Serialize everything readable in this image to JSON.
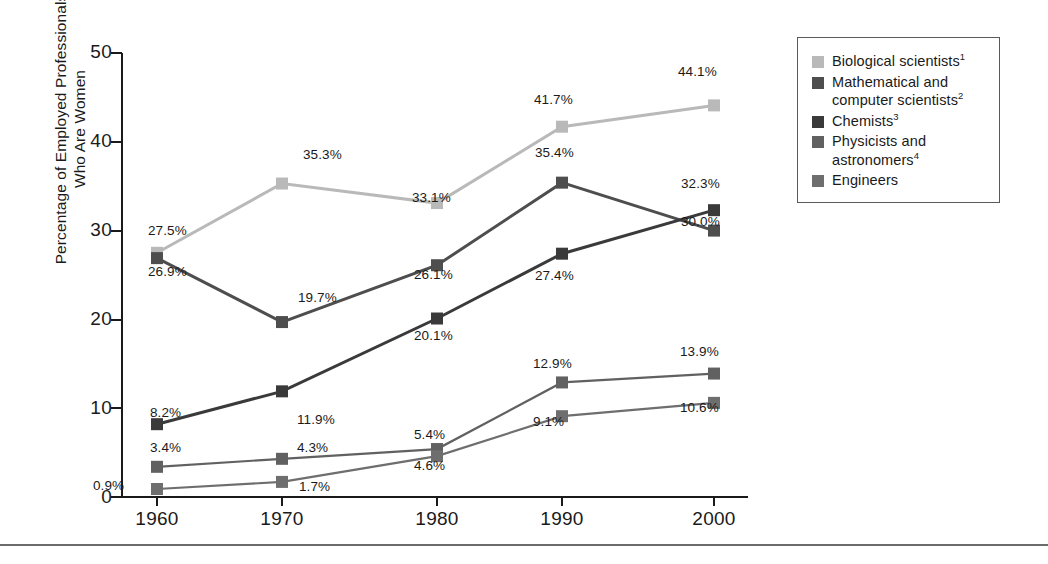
{
  "chart_data": {
    "type": "line",
    "title": "",
    "xlabel": "",
    "ylabel": "Percentage of Employed Professionals\nWho Are Women",
    "categories": [
      "1960",
      "1970",
      "1980",
      "1990",
      "2000"
    ],
    "x": [
      1960,
      1970,
      1980,
      1990,
      2000
    ],
    "ylim": [
      0,
      50
    ],
    "yticks": [
      "0",
      "10",
      "20",
      "30",
      "40",
      "50"
    ],
    "ytick_values": [
      0,
      10,
      20,
      30,
      40,
      50
    ],
    "grid": false,
    "legend_position": "top-right-outside",
    "series": [
      {
        "name": "Biological scientists",
        "footnote": "1",
        "color": "#b9b9b9",
        "values": [
          27.5,
          35.3,
          33.1,
          41.7,
          44.1
        ],
        "labels": [
          "27.5%",
          "35.3%",
          "33.1%",
          "41.7%",
          "44.1%"
        ]
      },
      {
        "name": "Mathematical and computer scientists",
        "footnote": "2",
        "color": "#4e4e4e",
        "values": [
          26.9,
          19.7,
          26.1,
          35.4,
          30.0
        ],
        "labels": [
          "26.9%",
          "19.7%",
          "26.1%",
          "35.4%",
          "30.0%"
        ]
      },
      {
        "name": "Chemists",
        "footnote": "3",
        "color": "#3a3a3a",
        "values": [
          8.2,
          11.9,
          20.1,
          27.4,
          32.3
        ],
        "labels": [
          "8.2%",
          "11.9%",
          "20.1%",
          "27.4%",
          "32.3%"
        ]
      },
      {
        "name": "Physicists and astronomers",
        "footnote": "4",
        "color": "#616161",
        "values": [
          3.4,
          4.3,
          5.4,
          12.9,
          13.9
        ],
        "labels": [
          "3.4%",
          "4.3%",
          "5.4%",
          "12.9%",
          "13.9%"
        ]
      },
      {
        "name": "Engineers",
        "footnote": "",
        "color": "#6e6e6e",
        "values": [
          0.9,
          1.7,
          4.6,
          9.1,
          10.6
        ],
        "labels": [
          "0.9%",
          "1.7%",
          "4.6%",
          "9.1%",
          "10.6%"
        ]
      }
    ]
  },
  "axis": {
    "y_title": "Percentage of Employed Professionals\nWho Are Women",
    "y_ticks": [
      "50",
      "40",
      "30",
      "20",
      "10",
      "0"
    ],
    "x_ticks": [
      "1960",
      "1970",
      "1980",
      "1990",
      "2000"
    ]
  },
  "legend": {
    "items": [
      {
        "label": "Biological scientists",
        "sup": "1",
        "color": "#b9b9b9"
      },
      {
        "label": "Mathematical and computer scientists",
        "sup": "2",
        "color": "#4e4e4e"
      },
      {
        "label": "Chemists",
        "sup": "3",
        "color": "#3a3a3a"
      },
      {
        "label": "Physicists and astronomers",
        "sup": "4",
        "color": "#616161"
      },
      {
        "label": "Engineers",
        "sup": "",
        "color": "#6e6e6e"
      }
    ]
  },
  "point_labels": {
    "bio": [
      "27.5%",
      "35.3%",
      "33.1%",
      "41.7%",
      "44.1%"
    ],
    "math": [
      "26.9%",
      "19.7%",
      "26.1%",
      "35.4%",
      "30.0%"
    ],
    "chem": [
      "8.2%",
      "11.9%",
      "20.1%",
      "27.4%",
      "32.3%"
    ],
    "phys": [
      "3.4%",
      "4.3%",
      "5.4%",
      "12.9%",
      "13.9%"
    ],
    "eng": [
      "0.9%",
      "1.7%",
      "4.6%",
      "9.1%",
      "10.6%"
    ]
  }
}
